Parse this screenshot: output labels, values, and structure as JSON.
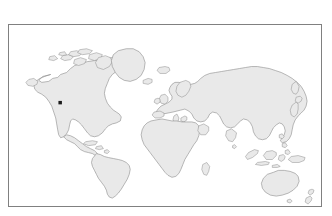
{
  "figure": {
    "kind": "world-map-with-location-marker",
    "background_color": "#ffffff",
    "frame": {
      "border_color": "#808080",
      "border_width_px": 1,
      "x": 8,
      "y": 24,
      "width": 314,
      "height": 183
    },
    "ocean_color": "#ffffff",
    "land_fill_color": "#e9e9e9",
    "land_outline_color": "#8a8a8a",
    "projection_hint": "equirectangular"
  },
  "marker": {
    "name": "location-marker",
    "shape": "square-dot",
    "color": "#1a1a1a",
    "size_px": 3.5,
    "pixel_x": 60.5,
    "pixel_y": 103.5,
    "region_label": "southwestern North America"
  },
  "landmasses": [
    {
      "id": "north-america",
      "label": "North America"
    },
    {
      "id": "greenland",
      "label": "Greenland"
    },
    {
      "id": "canadian-arctic",
      "label": "Canadian Arctic Archipelago"
    },
    {
      "id": "central-america",
      "label": "Central America"
    },
    {
      "id": "caribbean",
      "label": "Caribbean Islands"
    },
    {
      "id": "south-america",
      "label": "South America"
    },
    {
      "id": "eurasia",
      "label": "Eurasia"
    },
    {
      "id": "africa",
      "label": "Africa"
    },
    {
      "id": "madagascar",
      "label": "Madagascar"
    },
    {
      "id": "british-isles",
      "label": "British Isles"
    },
    {
      "id": "iceland",
      "label": "Iceland"
    },
    {
      "id": "scandinavia",
      "label": "Scandinavia"
    },
    {
      "id": "japan",
      "label": "Japan"
    },
    {
      "id": "indonesia",
      "label": "Indonesian Archipelago"
    },
    {
      "id": "philippines",
      "label": "Philippines"
    },
    {
      "id": "new-guinea",
      "label": "New Guinea"
    },
    {
      "id": "australia",
      "label": "Australia"
    },
    {
      "id": "new-zealand",
      "label": "New Zealand"
    },
    {
      "id": "sri-lanka",
      "label": "Sri Lanka"
    },
    {
      "id": "taiwan",
      "label": "Taiwan"
    },
    {
      "id": "tasmania",
      "label": "Tasmania"
    }
  ],
  "labels": {
    "title": "",
    "caption": ""
  }
}
